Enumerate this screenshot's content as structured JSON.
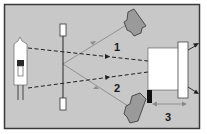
{
  "diagram": {
    "type": "optical-schematic",
    "colors": {
      "panel_bg": "#c8c8c8",
      "panel_border": "#3a3a3a",
      "component_fill": "#ffffff",
      "sensor_fill": "#9a9a9a",
      "beam_dark": "#1f1f1f",
      "beam_gray": "#8a8a8a",
      "marker_black": "#111111"
    },
    "components": [
      {
        "id": "lamp",
        "name": "light source (lamp)"
      },
      {
        "id": "rod",
        "name": "vertical rod with end markers"
      },
      {
        "id": "sensor-top",
        "name": "upper detector"
      },
      {
        "id": "sensor-bottom",
        "name": "lower detector"
      },
      {
        "id": "target-box",
        "name": "target block"
      },
      {
        "id": "target-strip",
        "name": "reflective strip"
      },
      {
        "id": "marker",
        "name": "black reference marker"
      }
    ],
    "labels": {
      "beam1": "1",
      "beam2": "2",
      "distance3": "3"
    }
  }
}
